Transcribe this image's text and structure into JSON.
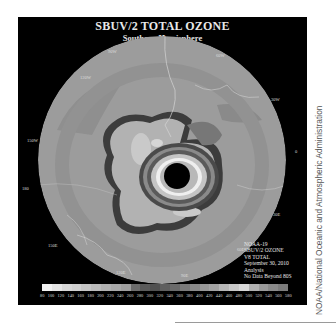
{
  "map": {
    "title": "SBUV/2 TOTAL OZONE",
    "subtitle": "Southern Hemisphere",
    "projection": "polar stereographic, South Pole centered",
    "longitude_labels": [
      {
        "label": "90W",
        "x": 90,
        "y": 32
      },
      {
        "label": "60W",
        "x": 198,
        "y": 36
      },
      {
        "label": "120W",
        "x": 62,
        "y": 58
      },
      {
        "label": "30W",
        "x": 253,
        "y": 80
      },
      {
        "label": "150W",
        "x": 27,
        "y": 121
      },
      {
        "label": "0",
        "x": 277,
        "y": 132
      },
      {
        "label": "180",
        "x": 22,
        "y": 169
      },
      {
        "label": "30E",
        "x": 255,
        "y": 195
      },
      {
        "label": "150E",
        "x": 48,
        "y": 226
      },
      {
        "label": "60E",
        "x": 219,
        "y": 230
      },
      {
        "label": "120E",
        "x": 98,
        "y": 253
      },
      {
        "label": "90E",
        "x": 163,
        "y": 256
      }
    ],
    "info_lines": [
      "NOAA-19",
      "SBUV/2 OZONE",
      "V8 TOTAL",
      "September 30, 2010",
      "Analysis",
      "No Data Beyond 80S"
    ],
    "colors": {
      "background": "#000000",
      "ocean_base": "#9a9a9a",
      "mid_ring": "#8c8c8c",
      "dark_contour": "#3a3a3a",
      "light_core": "#c8c8c8",
      "pole_no_data": "#000000",
      "coastline": "#d0d0d0"
    }
  },
  "colorbar": {
    "ticks": [
      "80",
      "100",
      "120",
      "140",
      "160",
      "180",
      "200",
      "220",
      "240",
      "260",
      "280",
      "300",
      "320",
      "340",
      "360",
      "380",
      "400",
      "420",
      "440",
      "460",
      "480",
      "500",
      "520",
      "540",
      "560",
      "580"
    ],
    "swatches": [
      "#f2f2f2",
      "#e4e4e4",
      "#d6d6d6",
      "#cfcfcf",
      "#c4c4c4",
      "#bababa",
      "#b0b0b0",
      "#a8a8a8",
      "#9e9e9e",
      "#6c6c6c",
      "#5a5a5a",
      "#505050",
      "#5e5e5e",
      "#6a6a6a",
      "#7a7a7a",
      "#8a8a8a",
      "#969696",
      "#a2a2a2",
      "#b6b6b6",
      "#c8c8c8",
      "#d8d8d8",
      "#b0b0b0",
      "#9a9a9a",
      "#8a8a8a",
      "#7c7c7c"
    ],
    "units": "Dobson Units"
  },
  "credit": "NOAA/National Oceanic and Atmospheric Administration"
}
